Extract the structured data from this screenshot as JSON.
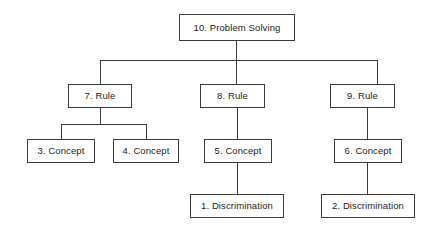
{
  "diagram": {
    "type": "hierarchy-tree",
    "background_color": "#ffffff",
    "line_color": "#3a3a3a",
    "text_color": "#1c1c1c",
    "box_fill": "#ffffff",
    "levels": [
      {
        "name": "problem-solving",
        "label": "Problem Solving"
      },
      {
        "name": "rule",
        "label": "Rule"
      },
      {
        "name": "concept",
        "label": "Concept"
      },
      {
        "name": "discrimination",
        "label": "Discrimination"
      }
    ],
    "nodes": [
      {
        "id": "n10",
        "number": "10",
        "type": "problem-solving",
        "label": "10. Problem Solving",
        "x": 179,
        "y": 14,
        "w": 116,
        "h": 27
      },
      {
        "id": "n7",
        "number": "7",
        "type": "rule",
        "label": "7. Rule",
        "x": 68,
        "y": 84,
        "w": 64,
        "h": 24
      },
      {
        "id": "n8",
        "number": "8",
        "type": "rule",
        "label": "8. Rule",
        "x": 200,
        "y": 84,
        "w": 65,
        "h": 24
      },
      {
        "id": "n9",
        "number": "9",
        "type": "rule",
        "label": "9. Rule",
        "x": 330,
        "y": 84,
        "w": 65,
        "h": 24
      },
      {
        "id": "n3",
        "number": "3",
        "type": "concept",
        "label": "3. Concept",
        "x": 27,
        "y": 139,
        "w": 68,
        "h": 24
      },
      {
        "id": "n4",
        "number": "4",
        "type": "concept",
        "label": "4. Concept",
        "x": 113,
        "y": 139,
        "w": 66,
        "h": 24
      },
      {
        "id": "n5",
        "number": "5",
        "type": "concept",
        "label": "5. Concept",
        "x": 204,
        "y": 139,
        "w": 68,
        "h": 24
      },
      {
        "id": "n6",
        "number": "6",
        "type": "concept",
        "label": "6. Concept",
        "x": 334,
        "y": 139,
        "w": 68,
        "h": 24
      },
      {
        "id": "n1",
        "number": "1",
        "type": "discrimination",
        "label": "1. Discrimination",
        "x": 190,
        "y": 194,
        "w": 94,
        "h": 24
      },
      {
        "id": "n2",
        "number": "2",
        "type": "discrimination",
        "label": "2. Discrimination",
        "x": 321,
        "y": 194,
        "w": 94,
        "h": 24
      }
    ],
    "edges": [
      {
        "from": "n10",
        "to": "n7"
      },
      {
        "from": "n10",
        "to": "n8"
      },
      {
        "from": "n10",
        "to": "n9"
      },
      {
        "from": "n7",
        "to": "n3"
      },
      {
        "from": "n7",
        "to": "n4"
      },
      {
        "from": "n8",
        "to": "n5"
      },
      {
        "from": "n9",
        "to": "n6"
      },
      {
        "from": "n5",
        "to": "n1"
      },
      {
        "from": "n6",
        "to": "n2"
      }
    ]
  }
}
